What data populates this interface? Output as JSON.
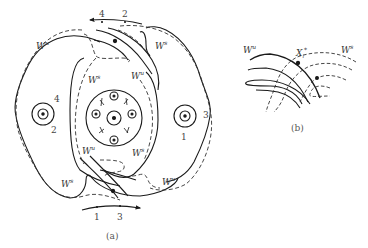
{
  "figure": {
    "panel_a": {
      "caption": "(a)",
      "manifold_labels": [
        {
          "base": "W",
          "sup": "u",
          "x": 38,
          "y": 36
        },
        {
          "base": "W",
          "sup": "s",
          "x": 153,
          "y": 38
        },
        {
          "base": "W",
          "sup": "s",
          "x": 86,
          "y": 72
        },
        {
          "base": "W",
          "sup": "u",
          "x": 130,
          "y": 68
        },
        {
          "base": "W",
          "sup": "u",
          "x": 82,
          "y": 143
        },
        {
          "base": "W",
          "sup": "s",
          "x": 132,
          "y": 145
        },
        {
          "base": "W",
          "sup": "s",
          "x": 61,
          "y": 176
        },
        {
          "base": "W",
          "sup": "u",
          "x": 162,
          "y": 176
        }
      ],
      "top_arrow_labels": [
        "4",
        "2"
      ],
      "bottom_arrow_labels": [
        "1",
        "3"
      ],
      "left_orbit_labels": [
        "4",
        "2"
      ],
      "right_orbit_labels": [
        "3",
        "1"
      ]
    },
    "panel_b": {
      "caption": "(b)",
      "labels": {
        "wu": {
          "base": "W",
          "sup": "u"
        },
        "ws": {
          "base": "W",
          "sup": "s"
        },
        "point": {
          "base": "X",
          "sub": "i",
          "sup": "*"
        }
      }
    },
    "colors": {
      "line": "#1a1a1a",
      "dashed": "#333333",
      "text": "#333333"
    }
  }
}
